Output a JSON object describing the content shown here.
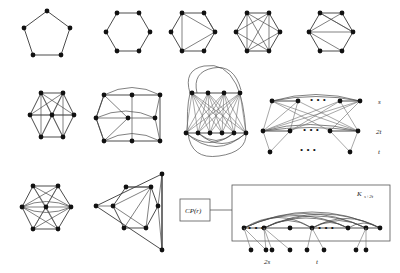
{
  "figure": {
    "background_color": "#ffffff",
    "vertex_color": "#111111",
    "edge_color": "#4a4a4a",
    "rows": [
      {
        "row_id": "row-1",
        "items": [
          {
            "id": "g1",
            "name": "pentagon-c5",
            "caption": ""
          },
          {
            "id": "g2",
            "name": "hexagon-c6",
            "caption": ""
          },
          {
            "id": "g3",
            "name": "hexagon-chorded-a",
            "caption": ""
          },
          {
            "id": "g4",
            "name": "hexagon-star-chords",
            "caption": ""
          },
          {
            "id": "g5",
            "name": "hexagon-chorded-b",
            "caption": ""
          }
        ]
      },
      {
        "row_id": "row-2",
        "items": [
          {
            "id": "g6",
            "name": "wheel-w6-center",
            "caption": ""
          },
          {
            "id": "g7",
            "name": "grid-3x3-curved",
            "caption": ""
          },
          {
            "id": "g8",
            "name": "complete-bipartite-oval",
            "caption": ""
          },
          {
            "id": "g9",
            "name": "tripartite-construction",
            "caption": ""
          }
        ]
      },
      {
        "row_id": "row-3",
        "items": [
          {
            "id": "g10",
            "name": "hexagon-center-chords",
            "caption": ""
          },
          {
            "id": "g11",
            "name": "triangular-nested-graph",
            "caption": ""
          },
          {
            "id": "g12",
            "name": "cocktail-party-schematic",
            "caption": ""
          }
        ]
      }
    ]
  },
  "labels": {
    "part_s": "s",
    "part_2t": "2t",
    "part_t": "t",
    "cp_box": "CP(r)",
    "clique_base": "K",
    "clique_sub": "s+2t",
    "bottom_2s": "2s",
    "bottom_t": "t",
    "ellipsis": "• • •"
  }
}
